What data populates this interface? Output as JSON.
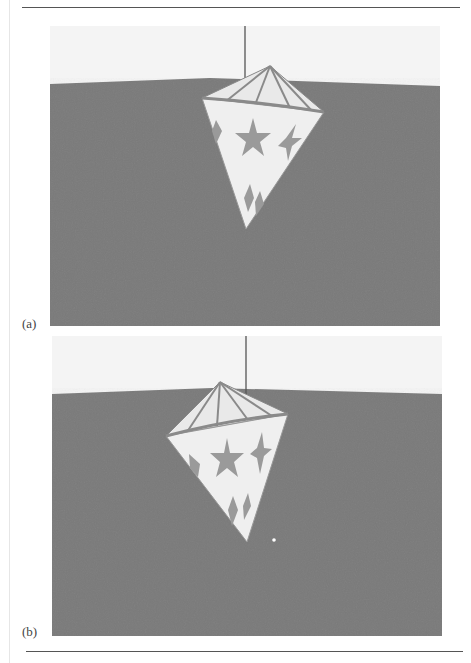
{
  "page": {
    "top_rule": true,
    "bottom_rule": true
  },
  "figure": {
    "panels": [
      {
        "label": "(a)",
        "description": "Hanging lantern with star pattern over gray ground plane, lantern tilted to the right",
        "colors": {
          "sky": "#f4f4f4",
          "ground": "#7a7a7a",
          "lantern": "#eeeeee",
          "star": "#9a9a9a",
          "rib": "#8a8a8a",
          "string": "#555555"
        }
      },
      {
        "label": "(b)",
        "description": "Same lantern swung to the left, with a small white particle below it",
        "colors": {
          "sky": "#f4f4f4",
          "ground": "#7a7a7a",
          "lantern": "#eeeeee",
          "star": "#9a9a9a",
          "rib": "#8a8a8a",
          "string": "#555555"
        }
      }
    ]
  }
}
